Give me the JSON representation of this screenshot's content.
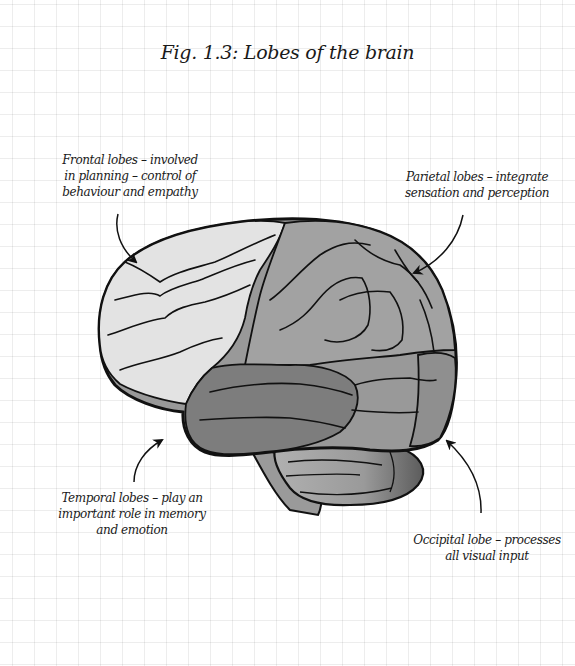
{
  "figure": {
    "title": "Fig. 1.3: Lobes of the brain"
  },
  "labels": {
    "frontal": {
      "lines": [
        "Frontal lobes – involved",
        "in planning – control of",
        "behaviour and empathy"
      ]
    },
    "parietal": {
      "lines": [
        "Parietal lobes – integrate",
        "sensation and perception"
      ]
    },
    "temporal": {
      "lines": [
        "Temporal lobes – play an",
        "important role in memory",
        "and emotion"
      ]
    },
    "occipital": {
      "lines": [
        "Occipital lobe – processes",
        "all visual input"
      ]
    }
  },
  "colors": {
    "background": "#ffffff",
    "grid": "#e6e6e6",
    "outline": "#111111",
    "frontal_lobe": "#e3e3e3",
    "parietal_lobe": "#9c9c9c",
    "temporal_lobe": "#7d7d7d",
    "occipital_lobe": "#8f8f8f",
    "cerebellum": "#a4a4a4",
    "brainstem": "#9a9a9a"
  }
}
